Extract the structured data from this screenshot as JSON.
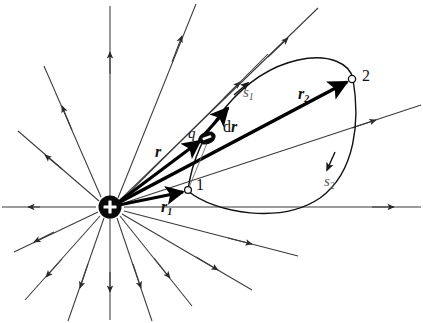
{
  "figure": {
    "domain_note": "physics vector diagram",
    "colors": {
      "line": "#111111",
      "field_line": "#3a3a3a",
      "path_curve": "#111111",
      "label": "#111111",
      "path_label": "#555555",
      "background": "#ffffff"
    },
    "source_charge": {
      "name": "source-charge",
      "symbol": "+",
      "polarity": "positive",
      "cx": 110,
      "cy": 207,
      "radius": 11
    },
    "moving_charge": {
      "name": "moving-charge",
      "label": "q",
      "symbol": "−",
      "polarity": "negative",
      "cx": 207,
      "cy": 138,
      "rx": 8,
      "ry": 5.5
    },
    "points": [
      {
        "id": "p1",
        "label": "1",
        "cx": 188,
        "cy": 190,
        "label_x": 196,
        "label_y": 177
      },
      {
        "id": "p2",
        "label": "2",
        "cx": 352,
        "cy": 79,
        "label_x": 362,
        "label_y": 68
      }
    ],
    "vectors": [
      {
        "id": "r1",
        "label": "r",
        "sub": "1",
        "label_x": 161,
        "label_y": 199,
        "from_x": 110,
        "from_y": 207,
        "to_x": 186,
        "to_y": 191
      },
      {
        "id": "r",
        "label": "r",
        "sub": "",
        "label_x": 155,
        "label_y": 144,
        "from_x": 110,
        "from_y": 207,
        "to_x": 203,
        "to_y": 140
      },
      {
        "id": "r2",
        "label": "r",
        "sub": "2",
        "label_x": 298,
        "label_y": 86,
        "from_x": 110,
        "from_y": 207,
        "to_x": 349,
        "to_y": 81
      },
      {
        "id": "dr",
        "label": "d",
        "bold_part": "r",
        "label_x": 223,
        "label_y": 119,
        "from_x": 205,
        "from_y": 135,
        "to_x": 226,
        "to_y": 110
      }
    ],
    "path_labels": [
      {
        "id": "s1",
        "label": "s",
        "sub": "1",
        "label_x": 243,
        "label_y": 85
      },
      {
        "id": "s2",
        "label": "s",
        "sub": "2",
        "label_x": 324,
        "label_y": 174
      }
    ],
    "paths": [
      {
        "id": "path-s1",
        "name": "path-s1-upper",
        "description": "upper curved path from point 1 to point 2"
      },
      {
        "id": "path-s2",
        "name": "path-s2-lower",
        "description": "lower curved path from point 2 back to point 1"
      }
    ],
    "field_lines": {
      "name": "radial-field-lines",
      "count": 16,
      "direction": "outward",
      "center_x": 110,
      "center_y": 207
    }
  }
}
